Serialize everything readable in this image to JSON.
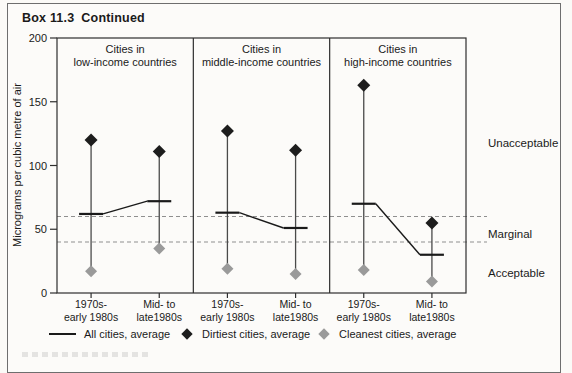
{
  "title": {
    "box_label": "Box 11.3",
    "continued": "Continued"
  },
  "chart_data": {
    "type": "line",
    "ylabel": "Micrograms per cubic metre of air",
    "ylim": [
      0,
      200
    ],
    "yticks": [
      0,
      50,
      100,
      150,
      200
    ],
    "grid": false,
    "categories": [
      [
        "1970s-",
        "early 1980s"
      ],
      [
        "Mid- to",
        "late1980s"
      ]
    ],
    "panels": [
      {
        "title": [
          "Cities in",
          "low-income countries"
        ],
        "series": {
          "all": [
            62,
            72
          ],
          "dirtiest": [
            120,
            111
          ],
          "cleanest": [
            17,
            35
          ]
        }
      },
      {
        "title": [
          "Cities in",
          "middle-income countries"
        ],
        "series": {
          "all": [
            63,
            51
          ],
          "dirtiest": [
            127,
            112
          ],
          "cleanest": [
            19,
            15
          ]
        }
      },
      {
        "title": [
          "Cities in",
          "high-income countries"
        ],
        "series": {
          "all": [
            70,
            30
          ],
          "dirtiest": [
            163,
            55
          ],
          "cleanest": [
            18,
            9
          ]
        }
      }
    ],
    "guidelines": [
      60,
      40
    ],
    "zone_labels": [
      {
        "label": "Unacceptable",
        "y_value": 118
      },
      {
        "label": "Marginal",
        "y_value": 46
      },
      {
        "label": "Acceptable",
        "y_value": 16
      }
    ],
    "legend": [
      {
        "label": "All cities, average",
        "marker": "line"
      },
      {
        "label": "Dirtiest cities, average",
        "marker": "diamond-black"
      },
      {
        "label": "Cleanest cities, average",
        "marker": "diamond-gray"
      }
    ],
    "legend_position": "bottom"
  },
  "colors": {
    "dirtiest": "#1d1d1d",
    "cleanest": "#9a9a9a",
    "line": "#1a1a1a",
    "range_line": "#4a4a4a",
    "guideline": "#8f8f8f",
    "frame": "#2e2e2e",
    "box_border": "#6e6e6e",
    "paper": "#fcfbf9",
    "text": "#1a1a1a"
  }
}
